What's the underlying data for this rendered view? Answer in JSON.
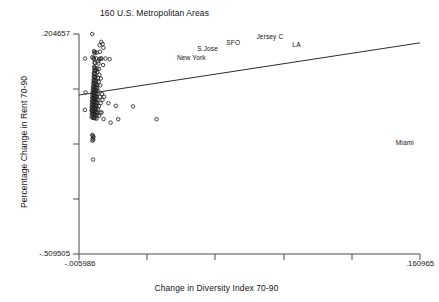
{
  "chart_data": {
    "type": "scatter",
    "title": "160 U.S. Metropolitan Areas",
    "xlabel": "Change in Diversity Index 70-90",
    "ylabel": "Percentage Change in Rent 70-90",
    "xlim": [
      -0.005986,
      0.160965
    ],
    "ylim": [
      -0.509505,
      0.204657
    ],
    "xticklabels": [
      "-.005986",
      ".160965"
    ],
    "yticklabels": [
      ".204657",
      "-.509505"
    ],
    "grid": false,
    "legend": null,
    "marker": "open-circle",
    "series": [
      {
        "name": "Metropolitan areas",
        "points": [
          [
            0.0005,
            0.2047
          ],
          [
            0.0049,
            0.179
          ],
          [
            0.0056,
            0.172
          ],
          [
            0.0041,
            0.168
          ],
          [
            0.006,
            0.16
          ],
          [
            0.0014,
            0.149
          ],
          [
            0.0018,
            0.1455
          ],
          [
            0.0016,
            0.142
          ],
          [
            0.0027,
            0.144
          ],
          [
            0.0043,
            0.147
          ],
          [
            -0.003,
            0.125
          ],
          [
            0.0005,
            0.129
          ],
          [
            0.0012,
            0.127
          ],
          [
            0.0013,
            0.1235
          ],
          [
            0.0025,
            0.1255
          ],
          [
            0.004,
            0.123
          ],
          [
            0.0048,
            0.126
          ],
          [
            0.005,
            0.124
          ],
          [
            0.007,
            0.125
          ],
          [
            0.009,
            0.123
          ],
          [
            0.0016,
            0.112
          ],
          [
            0.0019,
            0.11
          ],
          [
            0.0034,
            0.116
          ],
          [
            0.0036,
            0.109
          ],
          [
            0.0058,
            0.104
          ],
          [
            0.0014,
            0.098
          ],
          [
            0.0017,
            0.095
          ],
          [
            0.002,
            0.093
          ],
          [
            0.0029,
            0.093
          ],
          [
            0.0038,
            0.0915
          ],
          [
            0.0015,
            0.087
          ],
          [
            0.0018,
            0.0845
          ],
          [
            0.0022,
            0.0855
          ],
          [
            0.003,
            0.081
          ],
          [
            0.0013,
            0.078
          ],
          [
            0.0016,
            0.076
          ],
          [
            0.0019,
            0.0745
          ],
          [
            0.004,
            0.072
          ],
          [
            0.0012,
            0.068
          ],
          [
            0.0015,
            0.066
          ],
          [
            0.0018,
            0.065
          ],
          [
            0.0021,
            0.064
          ],
          [
            0.0033,
            0.062
          ],
          [
            0.0047,
            0.06
          ],
          [
            0.0011,
            0.056
          ],
          [
            0.0014,
            0.0545
          ],
          [
            0.0017,
            0.053
          ],
          [
            0.002,
            0.052
          ],
          [
            0.0025,
            0.0505
          ],
          [
            0.0036,
            0.049
          ],
          [
            0.001,
            0.045
          ],
          [
            0.0013,
            0.044
          ],
          [
            0.0016,
            0.0425
          ],
          [
            0.0019,
            0.0415
          ],
          [
            0.0024,
            0.04
          ],
          [
            0.003,
            0.0395
          ],
          [
            0.0044,
            0.038
          ],
          [
            0.0009,
            0.034
          ],
          [
            0.0012,
            0.033
          ],
          [
            0.0015,
            0.032
          ],
          [
            0.0018,
            0.031
          ],
          [
            0.0022,
            0.03
          ],
          [
            0.0028,
            0.029
          ],
          [
            0.0008,
            0.025
          ],
          [
            0.0011,
            0.024
          ],
          [
            0.0014,
            0.023
          ],
          [
            0.0017,
            0.0222
          ],
          [
            0.0021,
            0.0215
          ],
          [
            0.0026,
            0.0205
          ],
          [
            0.0035,
            0.0195
          ],
          [
            -0.0028,
            0.015
          ],
          [
            0.0007,
            0.0155
          ],
          [
            0.001,
            0.0145
          ],
          [
            0.0013,
            0.0138
          ],
          [
            0.0016,
            0.013
          ],
          [
            0.0019,
            0.0122
          ],
          [
            0.0023,
            0.0115
          ],
          [
            0.0031,
            0.0105
          ],
          [
            0.0053,
            0.0095
          ],
          [
            0.0006,
            0.006
          ],
          [
            0.0009,
            0.0052
          ],
          [
            0.0012,
            0.0045
          ],
          [
            0.0015,
            0.0038
          ],
          [
            0.0018,
            0.003
          ],
          [
            0.0022,
            0.0022
          ],
          [
            0.0027,
            0.0015
          ],
          [
            0.0042,
            0.0005
          ],
          [
            0.0063,
            0.0012
          ],
          [
            0.0005,
            -0.003
          ],
          [
            0.0008,
            -0.004
          ],
          [
            0.0011,
            -0.0048
          ],
          [
            0.0014,
            -0.0055
          ],
          [
            0.0017,
            -0.0062
          ],
          [
            0.002,
            -0.007
          ],
          [
            0.0024,
            -0.0078
          ],
          [
            0.0032,
            -0.0085
          ],
          [
            0.0055,
            -0.0095
          ],
          [
            0.0004,
            -0.013
          ],
          [
            0.0007,
            -0.014
          ],
          [
            0.001,
            -0.0148
          ],
          [
            0.0013,
            -0.0155
          ],
          [
            0.0016,
            -0.0162
          ],
          [
            0.0019,
            -0.017
          ],
          [
            0.0023,
            -0.0178
          ],
          [
            0.0029,
            -0.0185
          ],
          [
            0.0046,
            -0.0195
          ],
          [
            0.0084,
            -0.02
          ],
          [
            0.0003,
            -0.023
          ],
          [
            0.0006,
            -0.024
          ],
          [
            0.0009,
            -0.0248
          ],
          [
            0.0012,
            -0.0255
          ],
          [
            0.0015,
            -0.0262
          ],
          [
            0.0018,
            -0.027
          ],
          [
            0.0022,
            -0.0278
          ],
          [
            0.0026,
            -0.0285
          ],
          [
            0.0038,
            -0.0295
          ],
          [
            0.0002,
            -0.033
          ],
          [
            0.0005,
            -0.034
          ],
          [
            0.0008,
            -0.0348
          ],
          [
            0.0011,
            -0.0355
          ],
          [
            0.0014,
            -0.0362
          ],
          [
            0.0017,
            -0.037
          ],
          [
            0.0021,
            -0.0378
          ],
          [
            0.0025,
            -0.0385
          ],
          [
            0.0034,
            -0.0395
          ],
          [
            -0.0031,
            -0.042
          ],
          [
            0.0001,
            -0.044
          ],
          [
            0.0004,
            -0.045
          ],
          [
            0.0007,
            -0.0458
          ],
          [
            0.001,
            -0.0465
          ],
          [
            0.0013,
            -0.0472
          ],
          [
            0.0016,
            -0.048
          ],
          [
            0.002,
            -0.0488
          ],
          [
            0.0024,
            -0.0495
          ],
          [
            0.003,
            -0.0505
          ],
          [
            0.0045,
            -0.051
          ],
          [
            0.0051,
            -0.05
          ],
          [
            0.0003,
            -0.0545
          ],
          [
            0.0006,
            -0.0555
          ],
          [
            0.0009,
            -0.0562
          ],
          [
            0.0012,
            -0.057
          ],
          [
            0.0015,
            -0.0578
          ],
          [
            0.0019,
            -0.0585
          ],
          [
            0.0028,
            -0.0595
          ],
          [
            0.0039,
            -0.0605
          ],
          [
            0.0002,
            -0.065
          ],
          [
            0.0006,
            -0.0662
          ],
          [
            0.001,
            -0.0672
          ],
          [
            0.0014,
            -0.068
          ],
          [
            0.0018,
            -0.069
          ],
          [
            0.0026,
            -0.07
          ],
          [
            0.006,
            -0.0715
          ],
          [
            0.0132,
            -0.072
          ],
          [
            0.0095,
            -0.083
          ],
          [
            0.0005,
            -0.123
          ],
          [
            0.0008,
            -0.126
          ],
          [
            0.0011,
            -0.129
          ],
          [
            0.0007,
            -0.135
          ],
          [
            0.001,
            -0.138
          ],
          [
            0.0006,
            -0.142
          ],
          [
            0.0009,
            -0.203
          ],
          [
            0.012,
            -0.0285
          ],
          [
            0.0205,
            -0.0305
          ],
          [
            0.032,
            -0.072
          ]
        ]
      }
    ],
    "fit_line": {
      "name": "regression-line",
      "x_start": -0.005986,
      "x_end": 0.160965,
      "y_start": 0.0065,
      "y_end": 0.176
    },
    "annotations": [
      {
        "label": "Jersey C",
        "x": 0.0875,
        "y": 0.194
      },
      {
        "label": "SFO",
        "x": 0.0695,
        "y": 0.1745
      },
      {
        "label": "LA",
        "x": 0.1005,
        "y": 0.169
      },
      {
        "label": "S.Jose",
        "x": 0.057,
        "y": 0.1555
      },
      {
        "label": "New York",
        "x": 0.049,
        "y": 0.1265
      },
      {
        "label": "Miami",
        "x": 0.1535,
        "y": -0.148
      }
    ]
  }
}
